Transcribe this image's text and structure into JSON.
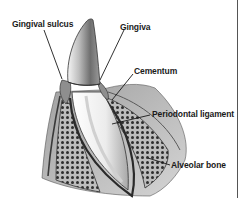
{
  "diagram": {
    "labels": [
      {
        "id": "gingival-sulcus",
        "text": "Gingival sulcus"
      },
      {
        "id": "gingiva",
        "text": "Gingiva"
      },
      {
        "id": "cementum",
        "text": "Cementum"
      },
      {
        "id": "periodontal-ligament",
        "text": "Periodontal ligament"
      },
      {
        "id": "alveolar-bone",
        "text": "Alveolar bone"
      }
    ],
    "colors": {
      "ink": "#1a1a1a",
      "enamel_shade": "#8a8a8a",
      "root": "#f2f2f2",
      "bone_fill": "#b5b5b5",
      "gum": "#9a9a9a",
      "border": "#555555"
    }
  }
}
